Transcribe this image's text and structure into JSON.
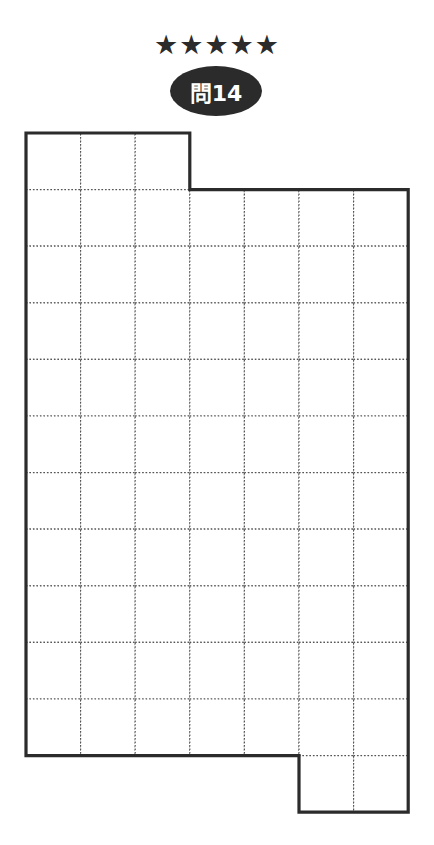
{
  "header": {
    "difficulty_stars": "★★★★★",
    "difficulty_level": 5,
    "problem_label": "問14"
  },
  "puzzle": {
    "columns": 7,
    "rows": 12,
    "origin": [
      26,
      133
    ],
    "cell_width": 54.6,
    "cell_height": 56.6,
    "row_spans": [
      {
        "row": 0,
        "from_col": 0,
        "to_col": 3
      },
      {
        "row": 1,
        "from_col": 0,
        "to_col": 7
      },
      {
        "row": 2,
        "from_col": 0,
        "to_col": 7
      },
      {
        "row": 3,
        "from_col": 0,
        "to_col": 7
      },
      {
        "row": 4,
        "from_col": 0,
        "to_col": 7
      },
      {
        "row": 5,
        "from_col": 0,
        "to_col": 7
      },
      {
        "row": 6,
        "from_col": 0,
        "to_col": 7
      },
      {
        "row": 7,
        "from_col": 0,
        "to_col": 7
      },
      {
        "row": 8,
        "from_col": 0,
        "to_col": 7
      },
      {
        "row": 9,
        "from_col": 0,
        "to_col": 7
      },
      {
        "row": 10,
        "from_col": 0,
        "to_col": 7
      },
      {
        "row": 11,
        "from_col": 5,
        "to_col": 7
      }
    ],
    "outline_color": "#2b2b2b",
    "gridline_color": "#555555"
  }
}
